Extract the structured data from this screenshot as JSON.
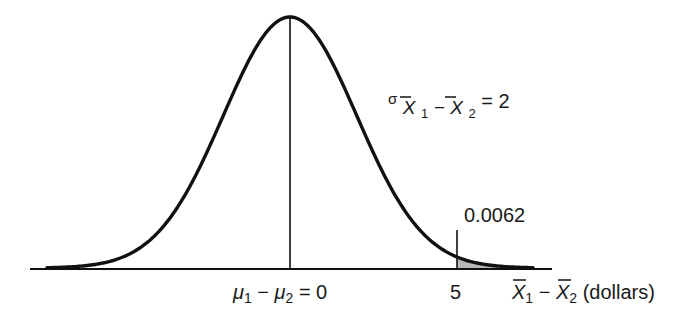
{
  "chart_data": {
    "type": "area",
    "title": "",
    "distribution": "normal",
    "mean": 0,
    "std_dev": 2,
    "mean_label": {
      "lhs": "μ1 − μ2",
      "rhs": "0"
    },
    "sigma_label": {
      "symbol": "σ",
      "subscript": "X̄1 − X̄2",
      "value": "2"
    },
    "xlabel": "X̄1 − X̄2 (dollars)",
    "ticks": [
      {
        "value": 0,
        "label": "μ1 − μ2 = 0"
      },
      {
        "value": 5,
        "label": "5"
      }
    ],
    "shaded_region": {
      "from": 5,
      "to": "inf",
      "area": 0.0062,
      "label": "0.0062"
    },
    "xlim": [
      -7.8,
      7.8
    ],
    "grid": false,
    "colors": {
      "curve": "#111111",
      "axis": "#111111",
      "shade": "#b8b8b8"
    }
  },
  "labels": {
    "mean_mu1": "μ",
    "mean_sub1": "1",
    "mean_minus": " − ",
    "mean_mu2": "μ",
    "mean_sub2": "2",
    "mean_eq": " = 0",
    "tick5": "5",
    "xlabel_x1": "X",
    "xlabel_sub1": "1",
    "xlabel_minus": " − ",
    "xlabel_x2": "X",
    "xlabel_sub2": "2",
    "xlabel_unit": " (dollars)",
    "sigma": "σ",
    "sigma_x1": "X",
    "sigma_sub1": "1",
    "sigma_minus": " − ",
    "sigma_x2": "X",
    "sigma_sub2": "2",
    "sigma_eq": " = 2",
    "area": "0.0062"
  }
}
